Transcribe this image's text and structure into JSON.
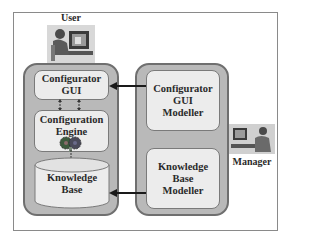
{
  "diagram": {
    "actors": {
      "user": {
        "label": "User",
        "icon": "person-at-computer-icon"
      },
      "manager": {
        "label": "Manager",
        "icon": "person-at-computer-icon"
      }
    },
    "left_column": {
      "configurator_gui": {
        "line1": "Configurator",
        "line2": "GUI"
      },
      "configuration_engine": {
        "line1": "Configuration",
        "line2": "Engine",
        "icon": "gears-icon"
      },
      "knowledge_base": {
        "line1": "Knowledge",
        "line2": "Base",
        "shape": "database-cylinder"
      }
    },
    "right_column": {
      "gui_modeller": {
        "line1": "Configurator",
        "line2": "GUI",
        "line3": "Modeller"
      },
      "kb_modeller": {
        "line1": "Knowledge",
        "line2": "Base",
        "line3": "Modeller"
      }
    },
    "connections": [
      {
        "from": "Configurator GUI Modeller",
        "to": "Configurator GUI",
        "type": "arrow"
      },
      {
        "from": "Knowledge Base Modeller",
        "to": "Knowledge Base",
        "type": "arrow"
      },
      {
        "from": "Configurator GUI",
        "to": "Configuration Engine",
        "type": "bidirectional-dashed"
      },
      {
        "from": "Configuration Engine",
        "to": "Knowledge Base",
        "type": "dashed"
      }
    ],
    "colors": {
      "column_fill": "#b9b9b9",
      "box_fill": "#ececec",
      "border": "#6f6f6f",
      "arrow": "#1a1a1a"
    }
  }
}
